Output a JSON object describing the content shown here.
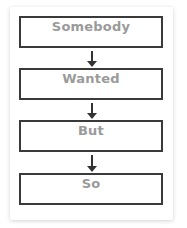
{
  "diagram": {
    "type": "flowchart",
    "steps": [
      {
        "label": "Somebody"
      },
      {
        "label": "Wanted"
      },
      {
        "label": "But"
      },
      {
        "label": "So"
      }
    ],
    "connectors": [
      "down-arrow",
      "down-arrow",
      "down-arrow"
    ],
    "colors": {
      "border": "#3a3a3a",
      "text": "#9a9a9a",
      "arrow": "#333333"
    }
  }
}
